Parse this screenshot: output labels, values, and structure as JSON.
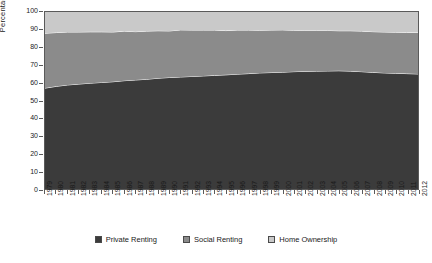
{
  "chart_data": {
    "type": "area",
    "title": "",
    "subtitle": "",
    "xlabel": "",
    "ylabel": "Percentage",
    "stacked": true,
    "grid": false,
    "legend_position": "bottom",
    "ylim": [
      0,
      100
    ],
    "y_ticks": [
      0,
      10,
      20,
      30,
      40,
      50,
      60,
      70,
      80,
      90,
      100
    ],
    "categories": [
      "1979",
      "1980",
      "1981",
      "1982",
      "1983",
      "1984",
      "1985",
      "1986",
      "1987",
      "1988",
      "1989",
      "1990",
      "1991",
      "1992",
      "1993",
      "1994",
      "1995",
      "1996",
      "1997",
      "1998",
      "1999",
      "2000",
      "2001",
      "2002",
      "2003",
      "2004",
      "2005",
      "2006",
      "2007",
      "2008",
      "2009",
      "2010",
      "2011",
      "2012"
    ],
    "series": [
      {
        "name": "Private Renting",
        "color": "#3b3b3b",
        "values": [
          57.0,
          58.0,
          58.8,
          59.3,
          59.8,
          60.2,
          60.6,
          61.2,
          61.6,
          62.0,
          62.6,
          63.0,
          63.3,
          63.6,
          63.9,
          64.2,
          64.5,
          64.9,
          65.2,
          65.6,
          65.8,
          66.0,
          66.3,
          66.5,
          66.6,
          66.7,
          66.8,
          66.6,
          66.3,
          65.9,
          65.6,
          65.4,
          65.2,
          65.0
        ]
      },
      {
        "name": "Social Renting",
        "color": "#8b8b8b",
        "values": [
          31.0,
          30.4,
          29.9,
          29.4,
          29.0,
          28.6,
          28.1,
          28.0,
          27.3,
          27.2,
          26.8,
          26.3,
          26.6,
          26.2,
          25.9,
          25.6,
          25.0,
          24.9,
          24.6,
          24.1,
          24.0,
          23.9,
          23.4,
          23.1,
          23.0,
          22.9,
          22.6,
          22.8,
          22.9,
          23.0,
          23.1,
          23.2,
          23.3,
          23.4
        ]
      },
      {
        "name": "Home Ownership",
        "color": "#c9c9c9",
        "values": [
          12.0,
          11.6,
          11.3,
          11.3,
          11.2,
          11.2,
          11.3,
          10.8,
          11.1,
          10.8,
          10.6,
          10.7,
          10.1,
          10.2,
          10.2,
          10.2,
          10.5,
          10.2,
          10.2,
          10.3,
          10.2,
          10.1,
          10.3,
          10.4,
          10.4,
          10.4,
          10.6,
          10.6,
          10.8,
          11.1,
          11.3,
          11.4,
          11.5,
          11.6
        ]
      }
    ]
  },
  "axis": {
    "y_title": "Percentage",
    "y_tick_labels": [
      "0",
      "10",
      "20",
      "30",
      "40",
      "50",
      "60",
      "70",
      "80",
      "90",
      "100"
    ],
    "x_tick_labels": [
      "1979",
      "1980",
      "1981",
      "1982",
      "1983",
      "1984",
      "1985",
      "1986",
      "1987",
      "1988",
      "1989",
      "1990",
      "1991",
      "1992",
      "1993",
      "1994",
      "1995",
      "1996",
      "1997",
      "1998",
      "1999",
      "2000",
      "2001",
      "2002",
      "2003",
      "2004",
      "2005",
      "2006",
      "2007",
      "2008",
      "2009",
      "2010",
      "2011",
      "2012"
    ]
  },
  "legend": {
    "items": [
      {
        "label": "Private Renting",
        "color": "#3b3b3b"
      },
      {
        "label": "Social Renting",
        "color": "#8b8b8b"
      },
      {
        "label": "Home Ownership",
        "color": "#c9c9c9"
      }
    ]
  },
  "colors": {
    "plot_background": "#f2f2f2",
    "page_background": "#ffffff",
    "axis": "#5a5a5a",
    "text": "#1a1a1a",
    "band_separator": "#ffffff"
  }
}
